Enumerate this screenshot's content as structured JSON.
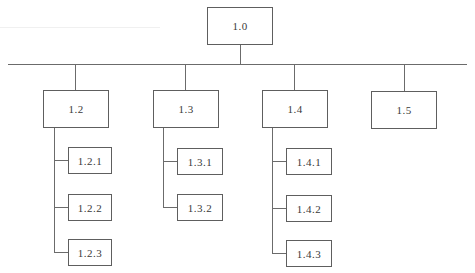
{
  "diagram": {
    "type": "org-chart",
    "root": {
      "id": "root",
      "label": "1.0"
    },
    "level1": [
      {
        "id": "n12",
        "label": "1.2",
        "children": [
          {
            "id": "n121",
            "label": "1.2.1"
          },
          {
            "id": "n122",
            "label": "1.2.2"
          },
          {
            "id": "n123",
            "label": "1.2.3"
          }
        ]
      },
      {
        "id": "n13",
        "label": "1.3",
        "children": [
          {
            "id": "n131",
            "label": "1.3.1"
          },
          {
            "id": "n132",
            "label": "1.3.2"
          }
        ]
      },
      {
        "id": "n14",
        "label": "1.4",
        "children": [
          {
            "id": "n141",
            "label": "1.4.1"
          },
          {
            "id": "n142",
            "label": "1.4.2"
          },
          {
            "id": "n143",
            "label": "1.4.3"
          }
        ]
      },
      {
        "id": "n15",
        "label": "1.5",
        "children": []
      }
    ]
  },
  "colors": {
    "line": "#6b6b6b",
    "border": "#5e5e5e",
    "text": "#3a3a3a",
    "background": "#ffffff"
  }
}
